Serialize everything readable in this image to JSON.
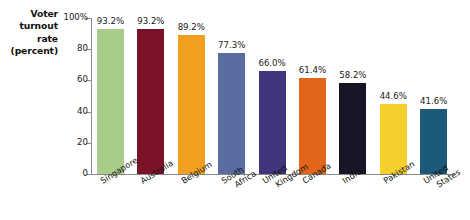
{
  "chart_data": {
    "type": "bar",
    "title": "",
    "ylabel": "Voter turnout rate (percent)",
    "xlabel": "",
    "ylim": [
      0,
      100
    ],
    "grid": false,
    "legend": false,
    "y_ticks": [
      {
        "value": 100,
        "label": "100%"
      },
      {
        "value": 80,
        "label": "80"
      },
      {
        "value": 60,
        "label": "60"
      },
      {
        "value": 40,
        "label": "40"
      },
      {
        "value": 20,
        "label": "20"
      },
      {
        "value": 0,
        "label": "0"
      }
    ],
    "categories": [
      "Singapore",
      "Australia",
      "Belgium",
      "South Africa",
      "United Kingdom",
      "Canada",
      "India",
      "Pakistan",
      "United States"
    ],
    "values": [
      93.2,
      93.2,
      89.2,
      77.3,
      66.0,
      61.4,
      58.2,
      44.6,
      41.6
    ],
    "value_labels": [
      "93.2%",
      "93.2%",
      "89.2%",
      "77.3%",
      "66.0%",
      "61.4%",
      "58.2%",
      "44.6%",
      "41.6%"
    ],
    "colors": [
      "#a8cd8a",
      "#7a1228",
      "#f0a01e",
      "#5a6ca0",
      "#42357d",
      "#e1661a",
      "#191426",
      "#f5cf2c",
      "#1c5a7a"
    ]
  },
  "axis_title": {
    "line1": "Voter",
    "line2": "turnout",
    "line3": "rate",
    "line4": "(percent)"
  },
  "category_label_lines": [
    [
      "Singapore"
    ],
    [
      "Australia"
    ],
    [
      "Belgium"
    ],
    [
      "South",
      "Africa"
    ],
    [
      "United",
      "Kingdom"
    ],
    [
      "Canada"
    ],
    [
      "India"
    ],
    [
      "Pakistan"
    ],
    [
      "United",
      "States"
    ]
  ]
}
